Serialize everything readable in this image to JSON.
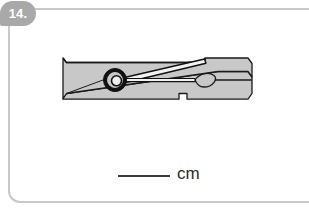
{
  "question": {
    "number_label": "14.",
    "frame": {
      "border_color": "#c9c9c9",
      "background_color": "#ffffff"
    },
    "badge": {
      "background_color": "#a9a9a9",
      "text_color": "#ffffff"
    }
  },
  "figure": {
    "name": "clothespin",
    "body_fill_color": "#c8c8c8",
    "outline_color": "#1a1a1a",
    "spring_color": "#111111",
    "parts": [
      "upper-jaw",
      "lower-jaw",
      "spring-coil",
      "spring-wire",
      "oval-detail",
      "bottom-notch"
    ]
  },
  "answer": {
    "blank_value": "",
    "blank_placeholder": "",
    "unit_label": "cm",
    "blank_line_color": "#3a3a3a",
    "unit_text_color": "#2b2b2b"
  }
}
